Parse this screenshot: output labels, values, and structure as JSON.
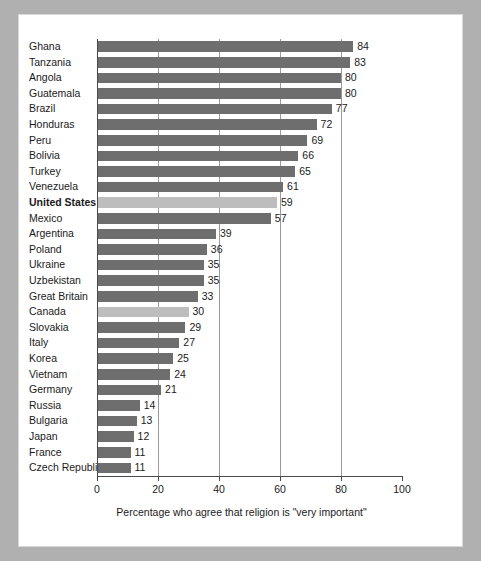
{
  "figure": {
    "background_color": "#b0b0b0",
    "panel_color": "#ffffff",
    "bar_color": "#6e6e6e",
    "highlight_bar_color": "#bdbdbd"
  },
  "chart_data": {
    "type": "bar",
    "orientation": "horizontal",
    "title": "",
    "xlabel": "Percentage who agree that religion is \"very important\"",
    "ylabel": "",
    "xlim": [
      0,
      100
    ],
    "xticks": [
      0,
      20,
      40,
      60,
      80,
      100
    ],
    "xticklabels": [
      "0",
      "20",
      "40",
      "60",
      "80",
      "100"
    ],
    "grid": true,
    "grid_axis": "x",
    "legend": null,
    "data_labels": true,
    "categories": [
      "Ghana",
      "Tanzania",
      "Angola",
      "Guatemala",
      "Brazil",
      "Honduras",
      "Peru",
      "Bolivia",
      "Turkey",
      "Venezuela",
      "United States",
      "Mexico",
      "Argentina",
      "Poland",
      "Ukraine",
      "Uzbekistan",
      "Great Britain",
      "Canada",
      "Slovakia",
      "Italy",
      "Korea",
      "Vietnam",
      "Germany",
      "Russia",
      "Bulgaria",
      "Japan",
      "France",
      "Czech Republic"
    ],
    "values": [
      84,
      83,
      80,
      80,
      77,
      72,
      69,
      66,
      65,
      61,
      59,
      57,
      39,
      36,
      35,
      35,
      33,
      30,
      29,
      27,
      25,
      24,
      21,
      14,
      13,
      12,
      11,
      11
    ],
    "highlighted": [
      "United States",
      "Canada"
    ],
    "bold_labels": [
      "United States"
    ]
  }
}
